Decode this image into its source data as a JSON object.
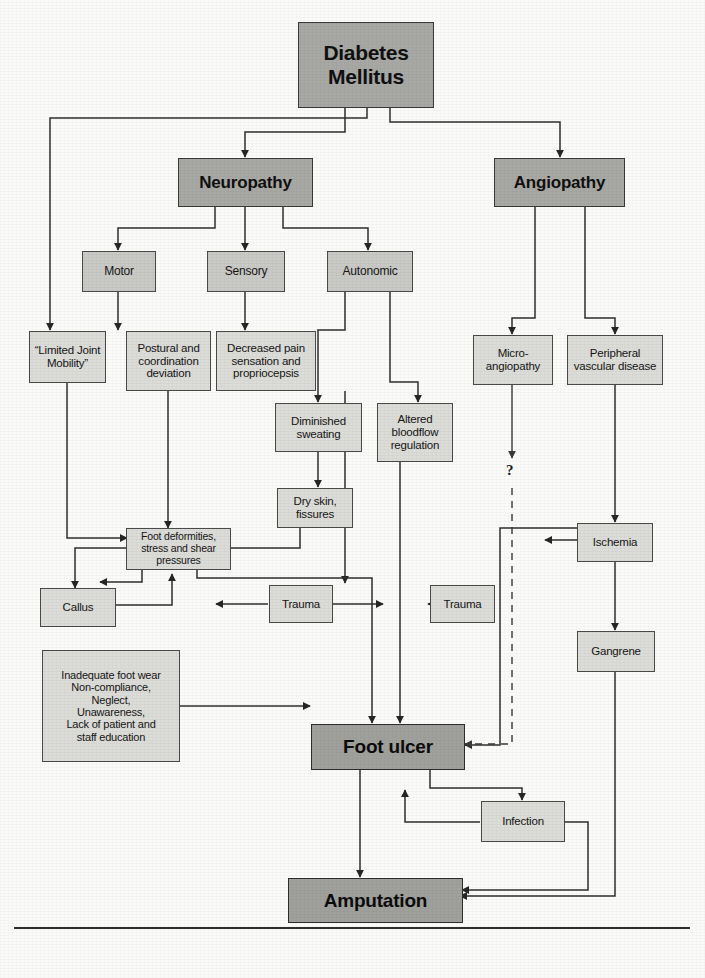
{
  "diagram": {
    "root": {
      "label": "Diabetes\nMellitus"
    },
    "nodes": [
      {
        "id": "diabetes",
        "label": "Diabetes Mellitus",
        "tier": "root"
      },
      {
        "id": "neuropathy",
        "label": "Neuropathy",
        "tier": "primary"
      },
      {
        "id": "angiopathy",
        "label": "Angiopathy",
        "tier": "primary"
      },
      {
        "id": "motor",
        "label": "Motor",
        "tier": "secondary"
      },
      {
        "id": "sensory",
        "label": "Sensory",
        "tier": "secondary"
      },
      {
        "id": "autonomic",
        "label": "Autonomic",
        "tier": "secondary"
      },
      {
        "id": "limited-joint-mobility",
        "label": "\"Limited Joint Mobility\"",
        "tier": "tertiary"
      },
      {
        "id": "postural-deviation",
        "label": "Postural and coordination deviation",
        "tier": "tertiary"
      },
      {
        "id": "decreased-pain",
        "label": "Decreased pain sensation and propriocepsis",
        "tier": "tertiary"
      },
      {
        "id": "micro-angiopathy",
        "label": "Micro-angiopathy",
        "tier": "tertiary"
      },
      {
        "id": "peripheral-vascular-disease",
        "label": "Peripheral vascular disease",
        "tier": "tertiary"
      },
      {
        "id": "diminished-sweating",
        "label": "Diminished sweating",
        "tier": "tertiary"
      },
      {
        "id": "altered-bloodflow",
        "label": "Altered bloodflow regulation",
        "tier": "tertiary"
      },
      {
        "id": "dry-skin",
        "label": "Dry skin, fissures",
        "tier": "tertiary"
      },
      {
        "id": "foot-deformities",
        "label": "Foot deformities, stress and shear pressures",
        "tier": "tertiary"
      },
      {
        "id": "ischemia",
        "label": "Ischemia",
        "tier": "tertiary"
      },
      {
        "id": "callus",
        "label": "Callus",
        "tier": "tertiary"
      },
      {
        "id": "trauma-left",
        "label": "Trauma",
        "tier": "tertiary"
      },
      {
        "id": "trauma-right",
        "label": "Trauma",
        "tier": "tertiary"
      },
      {
        "id": "gangrene",
        "label": "Gangrene",
        "tier": "tertiary"
      },
      {
        "id": "behavioural-factors",
        "label": "Inadequate foot wear Non-compliance, Neglect, Unawareness, Lack of patient and staff education",
        "tier": "tertiary"
      },
      {
        "id": "foot-ulcer",
        "label": "Foot ulcer",
        "tier": "outcome"
      },
      {
        "id": "infection",
        "label": "Infection",
        "tier": "tertiary"
      },
      {
        "id": "amputation",
        "label": "Amputation",
        "tier": "outcome"
      }
    ],
    "labels": {
      "diabetes_line1": "Diabetes",
      "diabetes_line2": "Mellitus",
      "neuropathy": "Neuropathy",
      "angiopathy": "Angiopathy",
      "motor": "Motor",
      "sensory": "Sensory",
      "autonomic": "Autonomic",
      "limited_joint_mobility_l1": "“Limited Joint",
      "limited_joint_mobility_l2": "Mobility”",
      "postural_l1": "Postural and",
      "postural_l2": "coordination",
      "postural_l3": "deviation",
      "decreased_pain_l1": "Decreased pain",
      "decreased_pain_l2": "sensation and",
      "decreased_pain_l3": "propriocepsis",
      "micro_angiopathy_l1": "Micro-",
      "micro_angiopathy_l2": "angiopathy",
      "pvd_l1": "Peripheral",
      "pvd_l2": "vascular disease",
      "diminished_sweating_l1": "Diminished",
      "diminished_sweating_l2": "sweating",
      "altered_bloodflow_l1": "Altered",
      "altered_bloodflow_l2": "bloodflow",
      "altered_bloodflow_l3": "regulation",
      "dry_skin_l1": "Dry skin,",
      "dry_skin_l2": "fissures",
      "foot_deformities_l1": "Foot deformities,",
      "foot_deformities_l2": "stress and shear",
      "foot_deformities_l3": "pressures",
      "ischemia": "Ischemia",
      "callus": "Callus",
      "trauma_left": "Trauma",
      "trauma_right": "Trauma",
      "gangrene": "Gangrene",
      "behaviour_l1": "Inadequate foot wear",
      "behaviour_l2": "Non-compliance,",
      "behaviour_l3": "Neglect,",
      "behaviour_l4": "Unawareness,",
      "behaviour_l5": "Lack of patient and",
      "behaviour_l6": "staff education",
      "foot_ulcer": "Foot ulcer",
      "infection": "Infection",
      "amputation": "Amputation",
      "question_mark": "?"
    },
    "edges": [
      {
        "from": "diabetes",
        "to": "neuropathy",
        "style": "solid"
      },
      {
        "from": "diabetes",
        "to": "angiopathy",
        "style": "solid"
      },
      {
        "from": "diabetes",
        "to": "limited-joint-mobility",
        "style": "solid"
      },
      {
        "from": "neuropathy",
        "to": "motor",
        "style": "solid"
      },
      {
        "from": "neuropathy",
        "to": "sensory",
        "style": "solid"
      },
      {
        "from": "neuropathy",
        "to": "autonomic",
        "style": "solid"
      },
      {
        "from": "motor",
        "to": "postural-deviation",
        "style": "solid"
      },
      {
        "from": "sensory",
        "to": "decreased-pain",
        "style": "solid"
      },
      {
        "from": "autonomic",
        "to": "diminished-sweating",
        "style": "solid"
      },
      {
        "from": "autonomic",
        "to": "altered-bloodflow",
        "style": "solid"
      },
      {
        "from": "angiopathy",
        "to": "micro-angiopathy",
        "style": "solid"
      },
      {
        "from": "angiopathy",
        "to": "peripheral-vascular-disease",
        "style": "solid"
      },
      {
        "from": "limited-joint-mobility",
        "to": "foot-deformities",
        "style": "solid"
      },
      {
        "from": "postural-deviation",
        "to": "foot-deformities",
        "style": "solid"
      },
      {
        "from": "diminished-sweating",
        "to": "dry-skin",
        "style": "solid"
      },
      {
        "from": "dry-skin",
        "to": "callus",
        "style": "solid"
      },
      {
        "from": "foot-deformities",
        "to": "callus",
        "style": "solid"
      },
      {
        "from": "callus",
        "to": "foot-deformities",
        "style": "solid"
      },
      {
        "from": "decreased-pain",
        "to": "trauma-left",
        "style": "solid"
      },
      {
        "from": "trauma-left",
        "to": "callus",
        "style": "solid"
      },
      {
        "from": "trauma-left",
        "to": "trauma-right",
        "style": "solid"
      },
      {
        "from": "peripheral-vascular-disease",
        "to": "ischemia",
        "style": "solid"
      },
      {
        "from": "ischemia",
        "to": "trauma-right",
        "style": "solid"
      },
      {
        "from": "ischemia",
        "to": "gangrene",
        "style": "solid"
      },
      {
        "from": "micro-angiopathy",
        "to": "foot-ulcer",
        "style": "dashed",
        "annotation": "?"
      },
      {
        "from": "altered-bloodflow",
        "to": "foot-ulcer",
        "style": "solid"
      },
      {
        "from": "foot-deformities",
        "to": "foot-ulcer",
        "style": "solid"
      },
      {
        "from": "behavioural-factors",
        "to": "foot-ulcer",
        "style": "solid"
      },
      {
        "from": "ischemia",
        "to": "foot-ulcer",
        "style": "solid"
      },
      {
        "from": "foot-ulcer",
        "to": "infection",
        "style": "solid"
      },
      {
        "from": "infection",
        "to": "foot-ulcer",
        "style": "solid"
      },
      {
        "from": "foot-ulcer",
        "to": "amputation",
        "style": "solid"
      },
      {
        "from": "gangrene",
        "to": "amputation",
        "style": "solid"
      },
      {
        "from": "infection",
        "to": "amputation",
        "style": "solid"
      }
    ],
    "colors": {
      "node_fill_light": "#dcdcd8",
      "node_fill_mid": "#c9c9c5",
      "node_fill_dark": "#a8a8a4",
      "stroke": "#3a3a3a",
      "text": "#141414",
      "page_background": "#fbfbfa"
    }
  }
}
